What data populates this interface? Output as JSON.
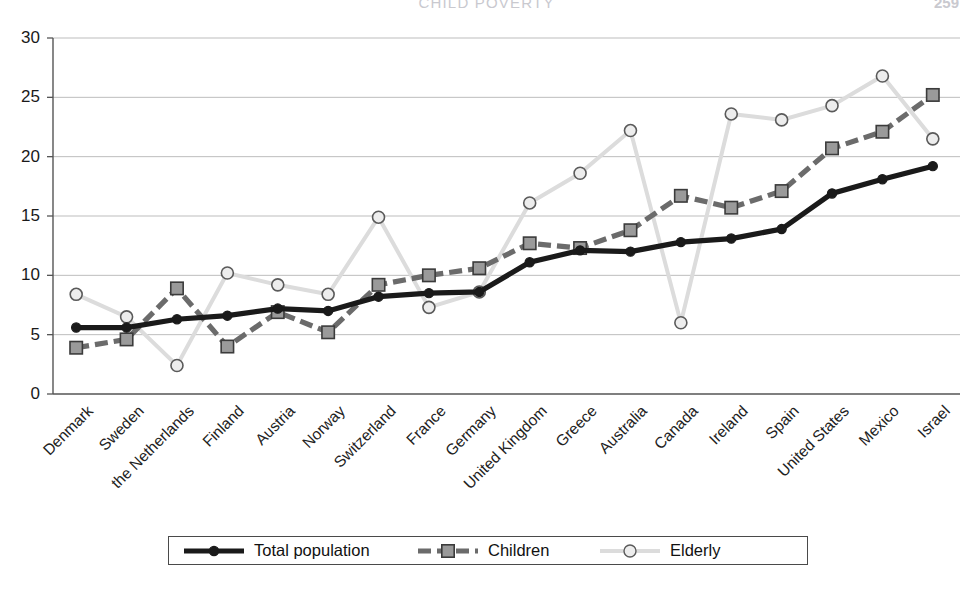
{
  "header": {
    "title": "CHILD POVERTY",
    "page_number": "259"
  },
  "chart_data": {
    "type": "line",
    "title": "",
    "xlabel": "",
    "ylabel": "",
    "ylim": [
      0,
      30
    ],
    "yticks": [
      0,
      5,
      10,
      15,
      20,
      25,
      30
    ],
    "grid": true,
    "legend_position": "bottom",
    "categories": [
      "Denmark",
      "Sweden",
      "the Netherlands",
      "Finland",
      "Austria",
      "Norway",
      "Switzerland",
      "France",
      "Germany",
      "United Kingdom",
      "Greece",
      "Australia",
      "Canada",
      "Ireland",
      "Spain",
      "United States",
      "Mexico",
      "Israel"
    ],
    "series": [
      {
        "name": "Total population",
        "color": "#1a1a1a",
        "marker": "circle",
        "values": [
          5.6,
          5.6,
          6.3,
          6.6,
          7.2,
          7.0,
          8.2,
          8.5,
          8.6,
          11.1,
          12.1,
          12.0,
          12.8,
          13.1,
          13.9,
          16.9,
          18.1,
          19.2
        ]
      },
      {
        "name": "Children",
        "color": "#6b6b6b",
        "marker": "square",
        "values": [
          3.9,
          4.6,
          8.9,
          4.0,
          6.9,
          5.2,
          9.2,
          10.0,
          10.6,
          12.7,
          12.3,
          13.8,
          16.7,
          15.7,
          17.1,
          20.7,
          22.1,
          25.2
        ]
      },
      {
        "name": "Elderly",
        "color": "#d9d9d9",
        "marker": "circle",
        "values": [
          8.4,
          6.5,
          2.4,
          10.2,
          9.2,
          8.4,
          14.9,
          7.3,
          8.6,
          16.1,
          18.6,
          22.2,
          6.0,
          23.6,
          23.1,
          24.3,
          26.8,
          21.5
        ]
      }
    ]
  },
  "legend": {
    "items": [
      {
        "label": "Total population",
        "style": "solid-black-dot"
      },
      {
        "label": "Children",
        "style": "dashed-gray-square"
      },
      {
        "label": "Elderly",
        "style": "light-gray-circle"
      }
    ]
  }
}
